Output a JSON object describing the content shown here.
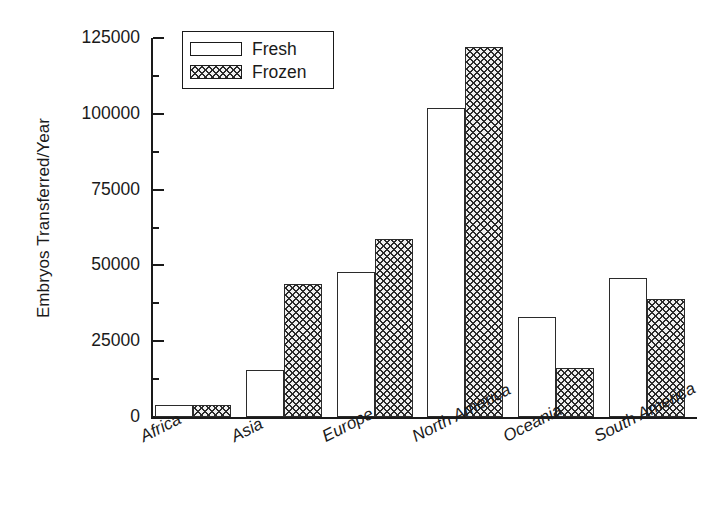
{
  "chart_data": {
    "type": "bar",
    "title": "",
    "xlabel": "",
    "ylabel": "Embryos Transferred/Year",
    "categories": [
      "Africa",
      "Asia",
      "Europe",
      "North America",
      "Oceania",
      "South America"
    ],
    "series": [
      {
        "name": "Fresh",
        "values": [
          4000,
          15500,
          47800,
          102000,
          33000,
          46000
        ]
      },
      {
        "name": "Frozen",
        "values": [
          3800,
          44000,
          58700,
          122000,
          16000,
          39000
        ]
      }
    ],
    "ylim": [
      0,
      125000
    ],
    "ytick_labels": [
      "0",
      "25000",
      "50000",
      "75000",
      "100000",
      "125000"
    ],
    "ytick_values": [
      0,
      25000,
      50000,
      75000,
      100000,
      125000
    ],
    "yminor_values": [
      12500,
      37500,
      62500,
      87500,
      112500
    ],
    "grid": false,
    "legend_position": "top-left-inside",
    "legend_entries": [
      "Fresh",
      "Frozen"
    ],
    "colors": {
      "axis": "#1a1a1a",
      "fresh_fill": "#ffffff",
      "frozen_fill": "#f0f0f0",
      "hatch": "#2b2b2b",
      "background": "#ffffff"
    },
    "xlabel_rotation_deg": -27
  }
}
